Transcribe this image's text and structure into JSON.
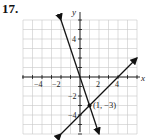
{
  "problem_number": "17.",
  "chart_data": {
    "type": "line",
    "title": "17.",
    "xlabel": "x",
    "ylabel": "y",
    "xlim": [
      -6,
      6
    ],
    "ylim": [
      -6,
      6
    ],
    "grid": true,
    "x_ticks": [
      -4,
      -2,
      2,
      4
    ],
    "y_ticks": [
      4,
      -2,
      -4
    ],
    "series": [
      {
        "name": "line 1 (negative slope)",
        "slope": -3,
        "intercept": 0,
        "points": [
          [
            -2,
            6
          ],
          [
            2,
            -6
          ]
        ]
      },
      {
        "name": "line 2 (positive slope)",
        "slope": 1,
        "intercept": -4,
        "points": [
          [
            -2,
            -6
          ],
          [
            6,
            2
          ]
        ]
      }
    ],
    "annotations": [
      {
        "text": "(1, −3)",
        "point": [
          1,
          -3
        ]
      }
    ]
  },
  "labels": {
    "x_axis": "x",
    "y_axis": "y",
    "xt_m4": "−4",
    "xt_m2": "−2",
    "xt_2": "2",
    "xt_4": "4",
    "yt_4": "4",
    "yt_m2": "−2",
    "yt_m4": "−4",
    "intersection": "(1, −3)"
  }
}
